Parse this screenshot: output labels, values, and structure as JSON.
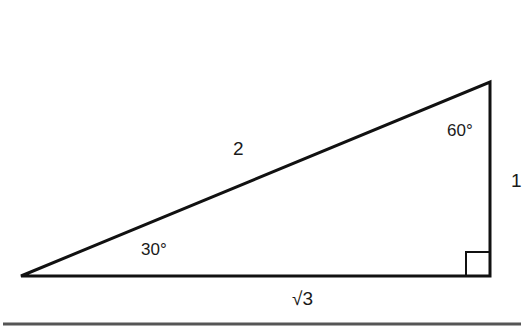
{
  "diagram": {
    "sides": {
      "hypotenuse": "2",
      "short_leg": "1",
      "long_leg": "√3"
    },
    "angles": {
      "left_vertex": "30°",
      "top_vertex": "60°",
      "right_angle": "90°"
    },
    "vertices": {
      "left": [
        21,
        276
      ],
      "bottom_right": [
        490,
        276
      ],
      "top_right": [
        490,
        82
      ]
    },
    "colors": {
      "stroke": "#111111",
      "background": "#ffffff",
      "rule": "#555555"
    }
  }
}
